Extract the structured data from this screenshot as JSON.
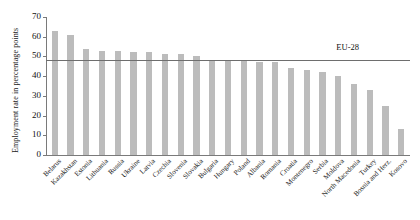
{
  "chart_data": {
    "type": "bar",
    "title": "",
    "xlabel": "",
    "ylabel": "Employment rate in percentage points",
    "ylim": [
      0,
      70
    ],
    "yticks": [
      0,
      10,
      20,
      30,
      40,
      50,
      60,
      70
    ],
    "grid": false,
    "legend": "none",
    "bar_color": "#bcbcbc",
    "categories": [
      "Belarus",
      "Kazakhstan",
      "Estonia",
      "Lithuania",
      "Russia",
      "Ukraine",
      "Latvia",
      "Czechia",
      "Slovenia",
      "Slovakia",
      "Bulgaria",
      "Hungary",
      "Poland",
      "Albania",
      "Romania",
      "Croatia",
      "Montenegro",
      "Serbia",
      "Moldova",
      "North Macedonia",
      "Turkey",
      "Bosnia and Herz.",
      "Kosovo"
    ],
    "values": [
      63,
      61,
      54,
      53,
      53,
      52,
      52,
      51,
      51,
      50,
      48,
      48,
      48,
      47,
      47,
      44,
      43,
      42,
      40,
      36,
      33,
      25,
      13
    ],
    "annotations": [
      {
        "label": "EU-28",
        "type": "horizontal-line",
        "value": 48,
        "label_x_fraction": 0.86
      }
    ]
  },
  "axis": {
    "y_tick_labels": [
      "0",
      "10",
      "20",
      "30",
      "40",
      "50",
      "60",
      "70"
    ]
  }
}
